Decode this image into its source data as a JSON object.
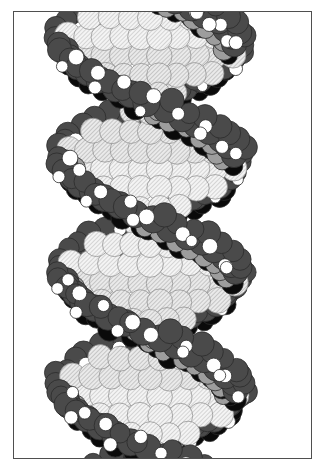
{
  "figure": {
    "title": "DNA double helix space-filling model",
    "model_type": "space-filling (CPK) atomic model",
    "rendering": "grayscale line illustration",
    "frame": {
      "border_color": "#4f4f4f",
      "border_width_px": 1,
      "left_px": 13,
      "top_px": 11,
      "width_px": 299,
      "height_px": 448,
      "background": "#ffffff"
    },
    "canvas": {
      "width_px": 329,
      "height_px": 470,
      "background": "#ffffff"
    }
  },
  "palette": {
    "white_sphere": "#ffffff",
    "black_sphere": "#0a0a0a",
    "dark_gray_sphere": "#4a4a4a",
    "mid_gray_sphere": "#9d9d9d",
    "light_hatch_fill": "#f2f2f2",
    "hatch_line": "#9a9a9a",
    "outline": "#2b2b2b",
    "frame_border": "#4f4f4f",
    "page_background": "#ffffff"
  },
  "atom_legend": [
    {
      "key": "base_pair",
      "label": "Base-pair atoms",
      "style": "light diagonal-hatched",
      "fill": "#f2f2f2"
    },
    {
      "key": "backbone_dark",
      "label": "Backbone carbon/phosphorus",
      "style": "solid dark gray",
      "fill": "#4a4a4a"
    },
    {
      "key": "backbone_mid",
      "label": "Backbone oxygen",
      "style": "solid mid gray",
      "fill": "#9d9d9d"
    },
    {
      "key": "shadowed",
      "label": "Shadowed/recessed atoms",
      "style": "solid black",
      "fill": "#0a0a0a"
    },
    {
      "key": "hydrogen",
      "label": "Hydrogen",
      "style": "solid white",
      "fill": "#ffffff"
    }
  ],
  "structure": {
    "helix_turns_shown": 2,
    "strand_count": 2,
    "axis_orientation": "vertical",
    "helix_center_x": 150,
    "helix_amplitude_px": 86,
    "helix_period_px": 232,
    "helix_phase_px": 24,
    "base_pair_rows": 26,
    "row_spacing_px": 19.0,
    "clipped_top": true,
    "clipped_bottom": true
  },
  "chart_data": {
    "type": "scatter",
    "title": "DNA double helix space-filling model",
    "xlabel": "",
    "ylabel": "",
    "xlim": [
      0,
      299
    ],
    "ylim": [
      0,
      448
    ],
    "grid": false,
    "legend": "none"
  }
}
